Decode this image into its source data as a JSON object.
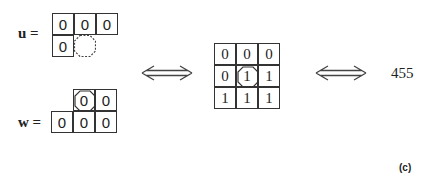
{
  "figure": {
    "caption": "(c)",
    "left_configs": {
      "u": {
        "label": "u =",
        "rows": [
          [
            "0",
            "0",
            "0"
          ],
          [
            "0",
            ""
          ]
        ],
        "highlight": "row 2, col 2 (dashed octagon, empty)"
      },
      "w": {
        "label": "w =",
        "rows": [
          [
            "0",
            "0"
          ],
          [
            "0",
            "0",
            "0"
          ]
        ],
        "highlight": "row 1, col 1 (octagon around 0)"
      }
    },
    "arrow_left": "double-headed arrow",
    "middle_grid": {
      "rows": [
        [
          "0",
          "0",
          "0"
        ],
        [
          "0",
          "1",
          "1"
        ],
        [
          "1",
          "1",
          "1"
        ]
      ],
      "highlight": "center cell (octagon around 1)"
    },
    "arrow_right": "double-headed arrow",
    "result_value": "455"
  }
}
